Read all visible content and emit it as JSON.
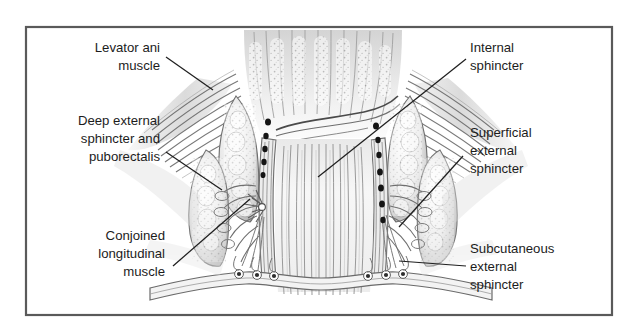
{
  "figure": {
    "frame_color": "#555555",
    "background_color": "#ffffff",
    "ink_color": "#3a3a3a",
    "label_color": "#1c1c1c",
    "labels": [
      {
        "id": "levator-ani",
        "side": "left",
        "lines": [
          "Levator ani",
          "muscle"
        ],
        "line1": "Levator ani",
        "line2": "muscle",
        "line3": ""
      },
      {
        "id": "deep-external-sphincter",
        "side": "left",
        "lines": [
          "Deep external",
          "sphincter and",
          "puborectalis"
        ],
        "line1": "Deep external",
        "line2": "sphincter and",
        "line3": "puborectalis"
      },
      {
        "id": "conjoined-longitudinal-muscle",
        "side": "left",
        "lines": [
          "Conjoined",
          "longitudinal",
          "muscle"
        ],
        "line1": "Conjoined",
        "line2": "longitudinal",
        "line3": "muscle"
      },
      {
        "id": "internal-sphincter",
        "side": "right",
        "lines": [
          "Internal",
          "sphincter"
        ],
        "line1": "Internal",
        "line2": "sphincter",
        "line3": ""
      },
      {
        "id": "superficial-external-sphincter",
        "side": "right",
        "lines": [
          "Superficial",
          "external",
          "sphincter"
        ],
        "line1": "Superficial",
        "line2": "external",
        "line3": "sphincter"
      },
      {
        "id": "subcutaneous-external-sphincter",
        "side": "right",
        "lines": [
          "Subcutaneous",
          "external",
          "sphincter"
        ],
        "line1": "Subcutaneous",
        "line2": "external",
        "line3": "sphincter"
      }
    ]
  }
}
